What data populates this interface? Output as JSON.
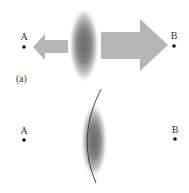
{
  "panel_a": {
    "label": "(a)",
    "point_a": {
      "label": "A",
      "x": 24,
      "y": 47
    },
    "point_b": {
      "label": "B",
      "x": 174,
      "y": 46
    },
    "left_arrow": {
      "direction": "left",
      "color": "#b5b5b5",
      "size": "small"
    },
    "right_arrow": {
      "direction": "right",
      "color": "#b5b5b5",
      "size": "large"
    },
    "blob": {
      "cx": 84,
      "cy": 45,
      "rx": 14,
      "ry": 37,
      "color": "#6e6e6e"
    }
  },
  "panel_b": {
    "point_a": {
      "label": "A",
      "x": 24,
      "y": 140
    },
    "point_b": {
      "label": "B",
      "x": 175,
      "y": 139
    },
    "blob": {
      "cx": 94,
      "cy": 140,
      "rx": 12,
      "ry": 37,
      "color": "#6e6e6e"
    },
    "curve": {
      "color": "#333333"
    }
  },
  "colors": {
    "arrow_fill": "#b5b5b5",
    "blob_core": "#6e6e6e",
    "ink": "#222222"
  }
}
